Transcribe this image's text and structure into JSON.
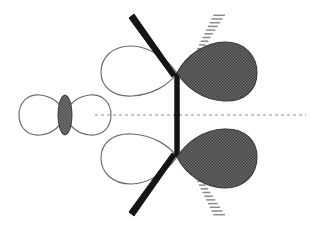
{
  "figure": {
    "canvas": {
      "width": 321,
      "height": 229,
      "background": "#ffffff"
    }
  },
  "colors": {
    "background": "#ffffff",
    "lobe_outline_stroke": "#6b6b6b",
    "lobe_empty_fill": "#ffffff",
    "lobe_filled_fill": "#5a5a5a",
    "lobe_filled_stroke": "#3a3a3a",
    "node_ellipse_fill": "#6e6e6e",
    "bond_bold": "#141414",
    "bond_hash": "#8a8a8a",
    "mirror_plane": "#8d8d8d"
  },
  "elements": {
    "mirror_plane": {
      "name": "mirror-plane",
      "style": "dashed",
      "y": 115,
      "x_start": 95,
      "x_end": 306
    },
    "left_orbital": {
      "name": "p-orbital",
      "label": "p orbital",
      "center_x": 65,
      "center_y": 115,
      "left_lobe_shading": "empty",
      "right_lobe_shading": "empty",
      "node_shading": "filled",
      "node_rx": 7,
      "node_ry": 20
    },
    "top_hybrid": {
      "name": "sp3-hybrid-orbital-top",
      "label": "sp3 hybrid orbital",
      "junction_x": 177,
      "junction_y": 73,
      "small_lobe_shading": "empty",
      "large_lobe_shading": "filled",
      "bonds": [
        {
          "name": "bold-wedge-bond-top",
          "type": "bold-wedge",
          "direction": "up-left"
        },
        {
          "name": "hashed-wedge-bond-top",
          "type": "hashed-wedge",
          "direction": "up-right"
        },
        {
          "name": "vertical-bold-bond-top",
          "type": "bold-line",
          "direction": "down"
        }
      ]
    },
    "bottom_hybrid": {
      "name": "sp3-hybrid-orbital-bottom",
      "label": "sp3 hybrid orbital",
      "junction_x": 177,
      "junction_y": 157,
      "small_lobe_shading": "empty",
      "large_lobe_shading": "filled",
      "bonds": [
        {
          "name": "bold-wedge-bond-bottom",
          "type": "bold-wedge",
          "direction": "down-left"
        },
        {
          "name": "hashed-wedge-bond-bottom",
          "type": "hashed-wedge",
          "direction": "down-right"
        },
        {
          "name": "vertical-bold-bond-bottom",
          "type": "bold-line",
          "direction": "up"
        }
      ]
    }
  }
}
